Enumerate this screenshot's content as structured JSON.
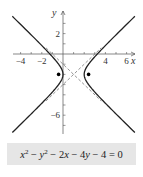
{
  "chart_data": {
    "type": "line",
    "title": "",
    "xlabel": "x",
    "ylabel": "y",
    "xlim": [
      -4.6,
      6.7
    ],
    "ylim": [
      -7.7,
      4.0
    ],
    "grid": false,
    "x_ticks": [
      -4,
      -2,
      4,
      6
    ],
    "y_ticks": [
      2,
      -6
    ],
    "x_tick_labels": [
      "−4",
      "−2",
      "4",
      "6"
    ],
    "y_tick_labels": [
      "2",
      "−6"
    ],
    "equation": "x^2 - y^2 - 2x - 4y - 4 = 0",
    "standard_form": "(x-1)^2 - (y+2)^2 = 1",
    "center": [
      1,
      -2
    ],
    "a": 1,
    "b": 1,
    "vertices": [
      [
        0,
        -2
      ],
      [
        2,
        -2
      ]
    ],
    "foci": [
      [
        -0.414,
        -2
      ],
      [
        2.414,
        -2
      ]
    ],
    "asymptotes": [
      "y + 2 = x - 1",
      "y + 2 = -(x - 1)"
    ],
    "series": [
      {
        "name": "hyperbola",
        "style": "solid",
        "color": "#222222"
      },
      {
        "name": "asymptotes",
        "style": "dashed",
        "color": "#555555"
      },
      {
        "name": "foci",
        "style": "points",
        "color": "#000000"
      }
    ]
  },
  "caption": {
    "parts": [
      "x",
      "2",
      " − ",
      "y",
      "2",
      " − 2",
      "x",
      " − 4",
      "y",
      " − 4 = 0"
    ]
  },
  "colors": {
    "curve": "#222222",
    "axis": "#555555",
    "asymptote": "#666666",
    "caption_bg": "#e6e6e6"
  }
}
